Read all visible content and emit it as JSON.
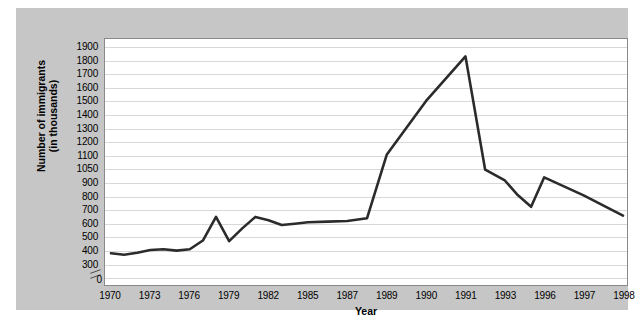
{
  "chart_data": {
    "type": "line",
    "title": "",
    "xlabel": "Year",
    "ylabel": "Number of immigrants (in thousands)",
    "ylabel_line1": "Number of immigrants",
    "ylabel_line2": "(in thousands)",
    "grid": true,
    "legend": "none",
    "axis_break": true,
    "axis_break_note": "y-axis broken between 300 and 0",
    "y_zero_label": "0",
    "y_ticks": [
      1900,
      1800,
      1700,
      1600,
      1500,
      1400,
      1300,
      1200,
      1100,
      1050,
      900,
      800,
      700,
      600,
      500,
      400,
      300
    ],
    "y_tick_labels": [
      "1900",
      "1800",
      "1700",
      "1600",
      "1500",
      "1400",
      "1300",
      "1200",
      "1100",
      "1050",
      "900",
      "800",
      "700",
      "600",
      "500",
      "400",
      "300"
    ],
    "categories": [
      "1970",
      "1973",
      "1976",
      "1979",
      "1982",
      "1985",
      "1987",
      "1989",
      "1990",
      "1991",
      "1993",
      "1996",
      "1997",
      "1998"
    ],
    "x_tick_labels": [
      "1970",
      "1973",
      "1976",
      "1979",
      "1982",
      "1985",
      "1987",
      "1989",
      "1990",
      "1991",
      "1993",
      "1996",
      "1997",
      "1998"
    ],
    "ylim": [
      300,
      1900
    ],
    "series": [
      {
        "name": "Number of immigrants",
        "color": "#2b2b2b",
        "points": [
          {
            "x": 1970,
            "y": 370
          },
          {
            "x": 1971,
            "y": 360
          },
          {
            "x": 1972,
            "y": 375
          },
          {
            "x": 1973,
            "y": 395
          },
          {
            "x": 1974,
            "y": 400
          },
          {
            "x": 1975,
            "y": 390
          },
          {
            "x": 1976,
            "y": 400
          },
          {
            "x": 1977,
            "y": 465
          },
          {
            "x": 1978,
            "y": 640
          },
          {
            "x": 1979,
            "y": 460
          },
          {
            "x": 1980,
            "y": 555
          },
          {
            "x": 1981,
            "y": 640
          },
          {
            "x": 1982,
            "y": 615
          },
          {
            "x": 1983,
            "y": 580
          },
          {
            "x": 1984,
            "y": 590
          },
          {
            "x": 1985,
            "y": 600
          },
          {
            "x": 1986,
            "y": 605
          },
          {
            "x": 1987,
            "y": 610
          },
          {
            "x": 1988,
            "y": 630
          },
          {
            "x": 1989,
            "y": 1100
          },
          {
            "x": 1990,
            "y": 1500
          },
          {
            "x": 1991,
            "y": 1830
          },
          {
            "x": 1992,
            "y": 1035
          },
          {
            "x": 1993,
            "y": 915
          },
          {
            "x": 1994,
            "y": 800
          },
          {
            "x": 1995,
            "y": 715
          },
          {
            "x": 1996,
            "y": 950
          },
          {
            "x": 1997,
            "y": 800
          },
          {
            "x": 1998,
            "y": 650
          }
        ]
      }
    ]
  }
}
